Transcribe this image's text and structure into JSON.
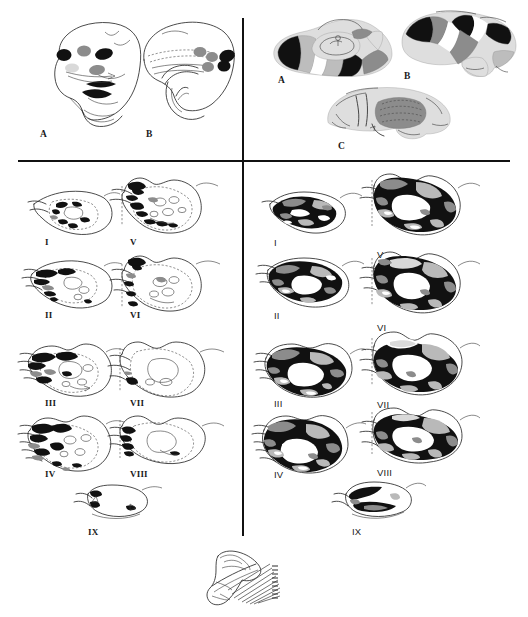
{
  "figure": {
    "background": "#ffffff"
  },
  "colors": {
    "outline": "#2b2b2b",
    "black_fill": "#111111",
    "dark_gray": "#8c8c8c",
    "mid_gray": "#b9b9b9",
    "light_gray": "#d9d9d9",
    "white_fill": "#ffffff",
    "divider": "#111111"
  },
  "dividers": {
    "horizontal": {
      "y": 160,
      "x": 18,
      "width": 492,
      "thickness": 1.6
    },
    "vertical": {
      "x": 242,
      "y": 18,
      "height": 518,
      "thickness": 1.6
    }
  },
  "panels": {
    "top_left": {
      "name": "lateral-hemisphere-drawings",
      "caption": "Lateral hemisphere line drawings with discrete filled deposits",
      "items": [
        {
          "label": "A",
          "x": 40,
          "y": 130,
          "caption": "Lateral view, rostral deposits"
        },
        {
          "label": "B",
          "x": 146,
          "y": 130,
          "caption": "Medial view with dashed tract outlines"
        }
      ]
    },
    "top_right": {
      "name": "shaded-hemisphere-views",
      "caption": "Three hemisphere views with shaded cortical territories",
      "items": [
        {
          "label": "A",
          "x": 278,
          "y": 76,
          "caption": "Dorsal / oblique view"
        },
        {
          "label": "B",
          "x": 404,
          "y": 72,
          "caption": "Lateral view"
        },
        {
          "label": "C",
          "x": 338,
          "y": 142,
          "caption": "Medial view"
        }
      ]
    },
    "bottom_left": {
      "name": "coronal-series-sparse",
      "caption": "Coronal section series, sparse labelling",
      "sections": [
        {
          "label": "I",
          "x": 45,
          "y": 238
        },
        {
          "label": "II",
          "x": 45,
          "y": 311
        },
        {
          "label": "III",
          "x": 45,
          "y": 399
        },
        {
          "label": "IV",
          "x": 45,
          "y": 470
        },
        {
          "label": "V",
          "x": 130,
          "y": 238
        },
        {
          "label": "VI",
          "x": 130,
          "y": 311
        },
        {
          "label": "VII",
          "x": 130,
          "y": 399
        },
        {
          "label": "VIII",
          "x": 130,
          "y": 470
        },
        {
          "label": "IX",
          "x": 88,
          "y": 528
        }
      ]
    },
    "bottom_right": {
      "name": "coronal-series-dense",
      "caption": "Coronal section series, dense labelling",
      "sections": [
        {
          "label": "I",
          "x": 274,
          "y": 238
        },
        {
          "label": "II",
          "x": 274,
          "y": 311
        },
        {
          "label": "III",
          "x": 274,
          "y": 399
        },
        {
          "label": "IV",
          "x": 274,
          "y": 470
        },
        {
          "label": "V",
          "x": 377,
          "y": 250
        },
        {
          "label": "VI",
          "x": 377,
          "y": 323
        },
        {
          "label": "VII",
          "x": 377,
          "y": 400
        },
        {
          "label": "VIII",
          "x": 377,
          "y": 468
        },
        {
          "label": "IX",
          "x": 352,
          "y": 527
        }
      ]
    },
    "bottom_key": {
      "name": "sagittal-section-level-key",
      "caption": "Small sagittal brain outline with hatched lines marking the coronal section levels",
      "x": 198,
      "y": 548,
      "width": 95,
      "height": 62
    }
  }
}
